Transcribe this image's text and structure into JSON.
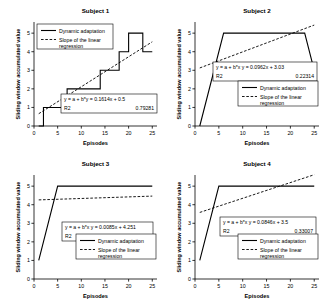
{
  "figure": {
    "panels": [
      "p1",
      "p2",
      "p3",
      "p4"
    ]
  },
  "axes": {
    "xlabel": "Episodes",
    "ylabel": "Sliding window accumulated value",
    "xticks": [
      "0",
      "5",
      "10",
      "15",
      "20",
      "25"
    ],
    "yticks": [
      "0",
      "1",
      "2",
      "3",
      "4",
      "5"
    ],
    "xlim": [
      0,
      26
    ],
    "ylim": [
      0,
      5.6
    ]
  },
  "legend": {
    "series1": "Dynamic adaptation",
    "series2_line1": "Slope of the linear",
    "series2_line2": "regression"
  },
  "labels": {
    "eq_prefix_y": "y = a + b*y",
    "eq_prefix_x": "y = a + b*x",
    "r2_label": "R2"
  },
  "chart_data": [
    {
      "type": "line",
      "title": "Subject 1",
      "xlabel": "Episodes",
      "ylabel": "Sliding window accumulated value",
      "xlim": [
        0,
        26
      ],
      "ylim": [
        0,
        5.6
      ],
      "xticks": [
        0,
        5,
        10,
        15,
        20,
        25
      ],
      "yticks": [
        0,
        1,
        2,
        3,
        4,
        5
      ],
      "grid": false,
      "legend_position": "upper-left",
      "series": [
        {
          "name": "Dynamic adaptation",
          "style": "solid",
          "x": [
            1,
            2,
            3,
            4,
            5,
            6,
            7,
            8,
            9,
            10,
            11,
            12,
            13,
            14,
            15,
            16,
            17,
            18,
            19,
            20,
            21,
            22,
            23,
            24,
            25
          ],
          "values": [
            0,
            1,
            1,
            1,
            1,
            1,
            2,
            2,
            2,
            2,
            2,
            2,
            2,
            3,
            3,
            3,
            3,
            4,
            4,
            5,
            5,
            5,
            4,
            4,
            4
          ]
        },
        {
          "name": "Slope of the linear regression",
          "style": "dashed",
          "x": [
            1,
            25
          ],
          "values": [
            0.6614,
            4.535
          ]
        }
      ],
      "annotation": {
        "equation": "y = a + b*y = 0.1614x + 0.5",
        "r2_label": "R2",
        "r2_value": "0.79281",
        "slope": 0.1614,
        "intercept": 0.5,
        "r2": 0.79281
      }
    },
    {
      "type": "line",
      "title": "Subject 2",
      "xlabel": "Episodes",
      "ylabel": "Sliding window accumulated value",
      "xlim": [
        0,
        26
      ],
      "ylim": [
        0,
        5.6
      ],
      "xticks": [
        0,
        5,
        10,
        15,
        20,
        25
      ],
      "yticks": [
        0,
        1,
        2,
        3,
        4,
        5
      ],
      "grid": false,
      "legend_position": "lower-right",
      "series": [
        {
          "name": "Dynamic adaptation",
          "style": "solid",
          "x": [
            1,
            6,
            23,
            25
          ],
          "values": [
            0,
            5,
            5,
            3
          ]
        },
        {
          "name": "Slope of the linear regression",
          "style": "dashed",
          "x": [
            1,
            25
          ],
          "values": [
            3.1262,
            5.435
          ]
        }
      ],
      "annotation": {
        "equation": "y = a + b*x   y = 0.0962x + 3.03",
        "r2_label": "R2",
        "r2_value": "0.22314",
        "slope": 0.0962,
        "intercept": 3.03,
        "r2": 0.22314
      }
    },
    {
      "type": "line",
      "title": "Subject 3",
      "xlabel": "Episodes",
      "ylabel": "Sliding window accumulated value",
      "xlim": [
        0,
        26
      ],
      "ylim": [
        0,
        5.6
      ],
      "xticks": [
        0,
        5,
        10,
        15,
        20,
        25
      ],
      "yticks": [
        0,
        1,
        2,
        3,
        4,
        5
      ],
      "grid": false,
      "legend_position": "lower-right",
      "series": [
        {
          "name": "Dynamic adaptation",
          "style": "solid",
          "x": [
            1,
            5,
            25
          ],
          "values": [
            1,
            5,
            5
          ]
        },
        {
          "name": "Slope of the linear regression",
          "style": "dashed",
          "x": [
            1,
            25
          ],
          "values": [
            4.2595,
            4.4635
          ]
        }
      ],
      "annotation": {
        "equation": "y = a + b*x   y = 0.0085x + 4.251",
        "r2_label": "R2",
        "r2_value": "0.02994",
        "slope": 0.0085,
        "intercept": 4.251,
        "r2": 0.02994
      }
    },
    {
      "type": "line",
      "title": "Subject 4",
      "xlabel": "Episodes",
      "ylabel": "Sliding window accumulated value",
      "xlim": [
        0,
        26
      ],
      "ylim": [
        0,
        5.6
      ],
      "xticks": [
        0,
        5,
        10,
        15,
        20,
        25
      ],
      "yticks": [
        0,
        1,
        2,
        3,
        4,
        5
      ],
      "grid": false,
      "legend_position": "lower-right",
      "series": [
        {
          "name": "Dynamic adaptation",
          "style": "solid",
          "x": [
            1,
            5,
            25
          ],
          "values": [
            1,
            5,
            5
          ]
        },
        {
          "name": "Slope of the linear regression",
          "style": "dashed",
          "x": [
            1,
            25
          ],
          "values": [
            3.5846,
            5.615
          ]
        }
      ],
      "annotation": {
        "equation": "y = a + b*x   y = 0.0846x + 3.5",
        "r2_label": "R2",
        "r2_value": "0.33007",
        "slope": 0.0846,
        "intercept": 3.5,
        "r2": 0.33007
      }
    }
  ]
}
